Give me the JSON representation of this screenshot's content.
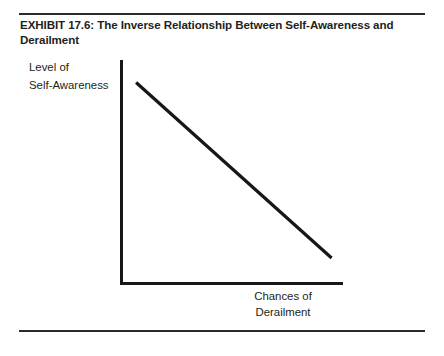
{
  "document": {
    "background_color": "#ffffff",
    "rule_color": "#2b2b2b",
    "ink_color": "#171717"
  },
  "title": {
    "text": "EXHIBIT 17.6: The Inverse Relationship Between Self-Awareness and Derailment",
    "exhibit_number": "17.6"
  },
  "labels": {
    "y_line_1": "Level of",
    "y_line_2": "Self-Awareness",
    "x_line_1": "Chances of",
    "x_line_2": "Derailment"
  },
  "chart_data": {
    "type": "line",
    "title": "EXHIBIT 17.6: The Inverse Relationship Between Self-Awareness and Derailment",
    "xlabel": "Chances of Derailment",
    "ylabel": "Level of Self-Awareness",
    "grid": false,
    "legend": "none",
    "axis_ticks": "none",
    "xlim": [
      0,
      1
    ],
    "ylim": [
      0,
      1
    ],
    "annotation": "A single straight line sloping downward from upper-left to lower-right, showing that as self-awareness decreases, the chances of derailment increase (inverse relationship).",
    "series": [
      {
        "name": "Inverse relationship",
        "x": [
          0.07,
          0.92
        ],
        "y": [
          0.9,
          0.12
        ]
      }
    ]
  }
}
